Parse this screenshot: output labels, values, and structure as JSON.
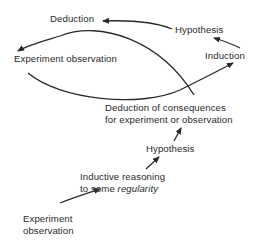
{
  "diagram": {
    "cycle": {
      "deduction": "Deduction",
      "hypothesis": "Hypothesis",
      "experiment_observation": "Experiment observation",
      "induction": "Induction"
    },
    "ladder": {
      "deduction_consequences_line1": "Deduction of consequences",
      "deduction_consequences_line2": "for experiment or observation",
      "hypothesis": "Hypothesis",
      "inductive_line1": "Inductive reasoning",
      "inductive_line2_prefix": "to some ",
      "inductive_line2_emphasis": "regularity",
      "experiment_line1": "Experiment",
      "experiment_line2": "observation"
    },
    "edges": [
      {
        "from": "Hypothesis",
        "to": "Deduction"
      },
      {
        "from": "Induction",
        "to": "Hypothesis"
      },
      {
        "from": "Experiment observation",
        "to": "Induction"
      },
      {
        "from": "Deduction of consequences",
        "to": "Experiment observation"
      },
      {
        "from": "Experiment observation (bottom)",
        "to": "Inductive reasoning"
      },
      {
        "from": "Inductive reasoning",
        "to": "Hypothesis (ladder)"
      },
      {
        "from": "Hypothesis (ladder)",
        "to": "Deduction of consequences"
      }
    ],
    "stroke_color": "#2a2a2a"
  }
}
